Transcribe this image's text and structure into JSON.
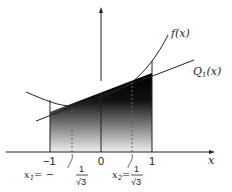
{
  "diagram": {
    "labels": {
      "f": "f(x)",
      "q": "Q",
      "q_sub": "1",
      "q_arg": "(x)",
      "x_axis": "x",
      "tick_neg1": "−1",
      "tick_0": "0",
      "tick_1": "1",
      "x1_name": "x",
      "x1_sub": "1",
      "x1_eq": "= −",
      "x2_name": "x",
      "x2_sub": "2",
      "x2_eq": "=",
      "frac_num": "1",
      "frac_den": "√3"
    },
    "colors": {
      "line": "#222222",
      "fill_top": "#000000",
      "fill_bottom": "#f2f2f2"
    }
  }
}
